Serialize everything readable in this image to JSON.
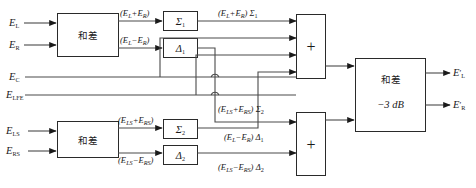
{
  "diagram": {
    "title_text": "",
    "type": "signal-flow-block-diagram",
    "colors": {
      "background": "#ffffff",
      "wire": "#4a4a4a",
      "box_stroke": "#2a2a2a",
      "text": "#1a1a1a"
    },
    "inputs": [
      {
        "id": "input-el",
        "label": "E",
        "sub": "L"
      },
      {
        "id": "input-er",
        "label": "E",
        "sub": "R"
      },
      {
        "id": "input-ec",
        "label": "E",
        "sub": "C"
      },
      {
        "id": "input-elfe",
        "label": "E",
        "sub": "LFE"
      },
      {
        "id": "input-els",
        "label": "E",
        "sub": "LS"
      },
      {
        "id": "input-ers",
        "label": "E",
        "sub": "RS"
      }
    ],
    "outputs": [
      {
        "id": "output-el-prime",
        "label": "E",
        "prime": "′",
        "sub": "L"
      },
      {
        "id": "output-er-prime",
        "label": "E",
        "prime": "′",
        "sub": "R"
      }
    ],
    "blocks": [
      {
        "id": "sum-diff-top",
        "label": "和差",
        "sublabel": ""
      },
      {
        "id": "sum-diff-bottom",
        "label": "和差",
        "sublabel": ""
      },
      {
        "id": "matrix-sigma-1",
        "label": "Σ",
        "sub": "1"
      },
      {
        "id": "matrix-delta-1",
        "label": "Δ",
        "sub": "1"
      },
      {
        "id": "matrix-sigma-2",
        "label": "Σ",
        "sub": "2"
      },
      {
        "id": "matrix-delta-2",
        "label": "Δ",
        "sub": "2"
      },
      {
        "id": "adder-top",
        "label": "+"
      },
      {
        "id": "adder-bottom",
        "label": "+"
      },
      {
        "id": "sum-diff-output",
        "label": "和差",
        "sublabel": "−3 dB"
      }
    ],
    "signal_labels": [
      {
        "id": "sig-sum-lr",
        "text": "(Eₗ+Eʀ)",
        "parts": [
          "(E",
          "L",
          "+E",
          "R",
          ")"
        ]
      },
      {
        "id": "sig-diff-lr",
        "text": "(Eₗ−Eʀ)",
        "parts": [
          "(E",
          "L",
          "−E",
          "R",
          ")"
        ]
      },
      {
        "id": "sig-sum-lr-sigma1",
        "text": "(Eₗ+Eʀ) Σ₁",
        "parts": [
          "(E",
          "L",
          "+E",
          "R",
          ") ",
          "Σ",
          "1"
        ]
      },
      {
        "id": "sig-sum-lsrs",
        "text": "(Eʟs+Eʀs)",
        "parts": [
          "(E",
          "LS",
          "+E",
          "RS",
          ")"
        ]
      },
      {
        "id": "sig-diff-lsrs",
        "text": "(Eʟs−Eʀs)",
        "parts": [
          "(E",
          "LS",
          "−E",
          "RS",
          ")"
        ]
      },
      {
        "id": "sig-sum-lsrs-sigma2",
        "text": "(Eʟs+Eʀs) Σ₂",
        "parts": [
          "(E",
          "LS",
          "+E",
          "RS",
          ") ",
          "Σ",
          "2"
        ]
      },
      {
        "id": "sig-diff-lr-delta1",
        "text": "(Eₗ−Eʀ) Δ₁",
        "parts": [
          "(E",
          "L",
          "−E",
          "R",
          ") ",
          "Δ",
          "1"
        ]
      },
      {
        "id": "sig-diff-lsrs-delta2",
        "text": "(Eʟs−Eʀs) Δ₂",
        "parts": [
          "(E",
          "LS",
          "−E",
          "RS",
          ") ",
          "Δ",
          "2"
        ]
      }
    ]
  }
}
